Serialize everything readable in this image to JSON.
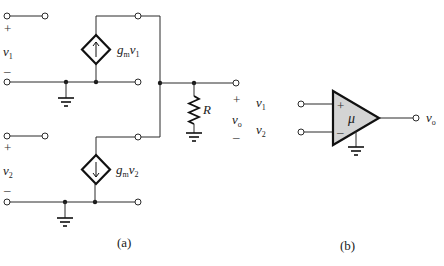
{
  "figure": {
    "a": {
      "caption": "(a)",
      "input1": {
        "var": "v",
        "sub": "1",
        "plus": "+",
        "minus": "–"
      },
      "input2": {
        "var": "v",
        "sub": "2",
        "plus": "+",
        "minus": "–"
      },
      "source1": {
        "gain": "g",
        "gain_sub": "m",
        "var": "v",
        "var_sub": "1",
        "arrow": "up"
      },
      "source2": {
        "gain": "g",
        "gain_sub": "m",
        "var": "v",
        "var_sub": "2",
        "arrow": "down"
      },
      "resistor": {
        "label": "R"
      },
      "output": {
        "var": "v",
        "sub": "o",
        "plus": "+",
        "minus": "–"
      }
    },
    "b": {
      "caption": "(b)",
      "input1": {
        "var": "v",
        "sub": "1"
      },
      "input2": {
        "var": "v",
        "sub": "2"
      },
      "plus_sign": "+",
      "minus_sign": "–",
      "gain": "μ",
      "output": {
        "var": "v",
        "sub": "o"
      }
    }
  }
}
